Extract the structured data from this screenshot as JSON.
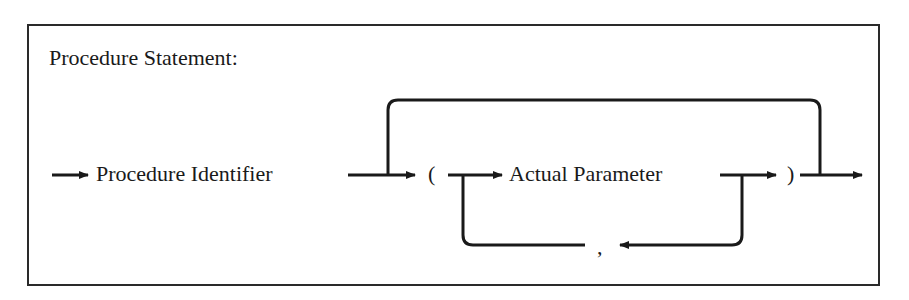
{
  "diagram": {
    "title": "Procedure Statement:",
    "nodes": [
      {
        "id": "proc-id",
        "label": "Procedure Identifier",
        "type": "nonterminal"
      },
      {
        "id": "lparen",
        "label": "(",
        "type": "terminal"
      },
      {
        "id": "actual-param",
        "label": "Actual Parameter",
        "type": "nonterminal"
      },
      {
        "id": "rparen",
        "label": ")",
        "type": "terminal"
      },
      {
        "id": "comma",
        "label": ",",
        "type": "terminal"
      }
    ],
    "edges": [
      {
        "from": "entry",
        "to": "proc-id"
      },
      {
        "from": "proc-id",
        "to": "lparen"
      },
      {
        "from": "proc-id",
        "to": "exit",
        "note": "bypass over parameter list"
      },
      {
        "from": "lparen",
        "to": "actual-param"
      },
      {
        "from": "actual-param",
        "to": "rparen"
      },
      {
        "from": "actual-param",
        "to": "comma",
        "note": "loop back"
      },
      {
        "from": "comma",
        "to": "actual-param"
      },
      {
        "from": "rparen",
        "to": "exit"
      }
    ],
    "colors": {
      "ink": "#1a1a1a",
      "background": "#ffffff"
    }
  }
}
